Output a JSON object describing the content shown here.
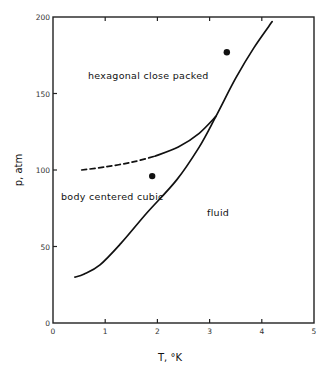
{
  "chart_data": {
    "type": "line",
    "title": "",
    "xlabel": "T, °K",
    "ylabel": "p, atm",
    "xlim": [
      0,
      5
    ],
    "ylim": [
      0,
      200
    ],
    "x_ticks": [
      "0",
      "1",
      "2",
      "3",
      "4",
      "5"
    ],
    "y_ticks": [
      "0",
      "50",
      "100",
      "150",
      "200"
    ],
    "grid": false,
    "legend": null,
    "series": [
      {
        "name": "melting curve (solid–fluid boundary)",
        "style": "solid",
        "points": [
          [
            0.42,
            30
          ],
          [
            0.6,
            32
          ],
          [
            0.9,
            38
          ],
          [
            1.3,
            52
          ],
          [
            1.8,
            72
          ],
          [
            2.37,
            93.5
          ],
          [
            2.8,
            115
          ],
          [
            3.12,
            135
          ],
          [
            3.5,
            160
          ],
          [
            3.85,
            180
          ],
          [
            4.2,
            197
          ]
        ]
      },
      {
        "name": "bcc–hcp boundary (extrapolated)",
        "style": "dashed",
        "points": [
          [
            0.55,
            100
          ],
          [
            1.0,
            102
          ],
          [
            1.5,
            105
          ],
          [
            1.95,
            109
          ]
        ]
      },
      {
        "name": "bcc–hcp boundary",
        "style": "solid",
        "points": [
          [
            1.95,
            109
          ],
          [
            2.4,
            115
          ],
          [
            2.8,
            124
          ],
          [
            3.12,
            135
          ]
        ]
      }
    ],
    "markers": [
      {
        "x": 1.9,
        "y": 96,
        "shape": "filled-circle"
      },
      {
        "x": 3.33,
        "y": 177,
        "shape": "filled-circle"
      }
    ],
    "annotations": [
      {
        "text": "hexagonal close packed",
        "x": 0.55,
        "y": 165
      },
      {
        "text": "body centered cubic",
        "x": 0.15,
        "y": 87
      },
      {
        "text": "fluid",
        "x": 3.25,
        "y": 75
      }
    ]
  },
  "labels": {
    "xlabel": "T, °K",
    "ylabel": "p, atm",
    "hcp": "hexagonal close packed",
    "bcc": "body centered cubic",
    "fluid": "fluid",
    "x_ticks": [
      "0",
      "1",
      "2",
      "3",
      "4",
      "5"
    ],
    "y_ticks": [
      "0",
      "50",
      "100",
      "150",
      "200"
    ]
  }
}
